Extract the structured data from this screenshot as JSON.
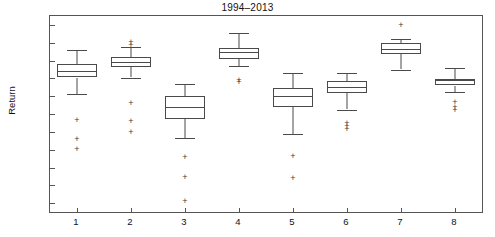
{
  "chart_data": {
    "type": "box",
    "title": "1994–2013",
    "xlabel": "",
    "ylabel": "Return",
    "ylim": [
      3.0,
      25.0
    ],
    "yticks": [
      "4%",
      "6%",
      "8%",
      "10%",
      "12%",
      "14%",
      "16%",
      "18%",
      "20%",
      "22%",
      "24%"
    ],
    "ytick_values": [
      4,
      6,
      8,
      10,
      12,
      14,
      16,
      18,
      20,
      22,
      24
    ],
    "categories": [
      "1",
      "2",
      "3",
      "4",
      "5",
      "6",
      "7",
      "8"
    ],
    "grid": false,
    "legend": null,
    "units": "percent",
    "boxes": [
      {
        "category": "1",
        "whisker_low": 16.2,
        "q1": 18.1,
        "median": 18.8,
        "q3": 19.6,
        "whisker_high": 21.2,
        "outliers": [
          13.3,
          11.2,
          10.1
        ]
      },
      {
        "category": "2",
        "whisker_low": 18.1,
        "q1": 19.3,
        "median": 19.8,
        "q3": 20.4,
        "whisker_high": 21.5,
        "outliers": [
          22.1,
          21.8,
          15.2,
          13.2,
          12.0
        ]
      },
      {
        "category": "3",
        "whisker_low": 11.3,
        "q1": 13.4,
        "median": 14.8,
        "q3": 16.0,
        "whisker_high": 17.4,
        "outliers": [
          9.2,
          6.9,
          4.2
        ]
      },
      {
        "category": "4",
        "whisker_low": 19.4,
        "q1": 20.2,
        "median": 21.0,
        "q3": 21.4,
        "whisker_high": 23.1,
        "outliers": [
          17.8,
          17.6
        ]
      },
      {
        "category": "5",
        "whisker_low": 11.8,
        "q1": 14.8,
        "median": 16.0,
        "q3": 16.9,
        "whisker_high": 18.6,
        "outliers": [
          9.3,
          6.8
        ]
      },
      {
        "category": "6",
        "whisker_low": 14.5,
        "q1": 16.4,
        "median": 17.0,
        "q3": 17.7,
        "whisker_high": 18.6,
        "outliers": [
          13.0,
          12.7,
          12.3
        ]
      },
      {
        "category": "7",
        "whisker_low": 19.0,
        "q1": 20.7,
        "median": 21.3,
        "q3": 22.0,
        "whisker_high": 22.4,
        "outliers": [
          24.0
        ]
      },
      {
        "category": "8",
        "whisker_low": 16.5,
        "q1": 17.2,
        "median": 17.8,
        "q3": 17.9,
        "whisker_high": 19.2,
        "outliers": [
          15.3,
          14.8,
          14.5
        ]
      }
    ]
  }
}
